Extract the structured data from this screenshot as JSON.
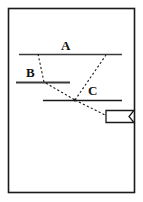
{
  "figure": {
    "title": "",
    "background_color": "#ffffff",
    "frame": {
      "name": "figure-border",
      "stroke_color": "#1a1a1a",
      "x": 8,
      "y": 8,
      "width": 127,
      "height": 185
    },
    "labels": [
      {
        "id": "A",
        "text": "A",
        "x": 61,
        "y": 39
      },
      {
        "id": "B",
        "text": "B",
        "x": 26,
        "y": 66
      },
      {
        "id": "C",
        "text": "C",
        "x": 88,
        "y": 84
      }
    ],
    "solid_lines": [
      {
        "name": "boundary-line-a",
        "x1": 19,
        "y1": 54,
        "x2": 122,
        "y2": 54,
        "color": "#3c3c3c"
      },
      {
        "name": "boundary-line-b",
        "x1": 16,
        "y1": 82,
        "x2": 70,
        "y2": 82,
        "color": "#3c3c3c"
      },
      {
        "name": "boundary-line-c",
        "x1": 43,
        "y1": 100,
        "x2": 122,
        "y2": 100,
        "color": "#1a1a1a"
      }
    ],
    "dashed_paths": [
      {
        "name": "incident-ray-path",
        "color": "#1a1a1a",
        "points": [
          {
            "x": 38,
            "y": 54
          },
          {
            "x": 44,
            "y": 82
          },
          {
            "x": 75,
            "y": 100
          }
        ]
      },
      {
        "name": "reflected-ray-path",
        "color": "#1a1a1a",
        "points": [
          {
            "x": 75,
            "y": 100
          },
          {
            "x": 106,
            "y": 55
          }
        ]
      },
      {
        "name": "transmitted-ray-path",
        "color": "#1a1a1a",
        "points": [
          {
            "x": 75,
            "y": 100
          },
          {
            "x": 107,
            "y": 116
          }
        ]
      }
    ],
    "junction_point": {
      "name": "ray-junction-node",
      "x": 75,
      "y": 100
    },
    "banner": {
      "name": "banner-flag",
      "x": 106,
      "y": 110,
      "width": 28,
      "height": 12,
      "notch_depth": 5,
      "stroke_color": "#1a1a1a",
      "fill_color": "#ffffff",
      "text": ""
    }
  }
}
